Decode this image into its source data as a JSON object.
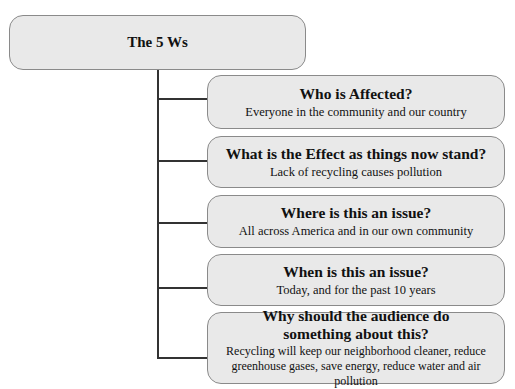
{
  "root": {
    "label": "The 5 Ws"
  },
  "children": [
    {
      "title": "Who is Affected?",
      "body": "Everyone in the community and our country"
    },
    {
      "title": "What is the Effect as things now stand?",
      "body": "Lack of recycling causes pollution"
    },
    {
      "title": "Where is this an issue?",
      "body": "All across America and in our own community"
    },
    {
      "title": "When is this an issue?",
      "body": "Today, and for the past 10 years"
    },
    {
      "title": "Why should the audience do something about this?",
      "body": "Recycling will keep our neighborhood cleaner, reduce greenhouse gases, save energy, reduce water and air pollution"
    }
  ],
  "colors": {
    "box_fill": "#e9e9e9",
    "box_border": "#8a8a8a",
    "connector": "#333333"
  }
}
